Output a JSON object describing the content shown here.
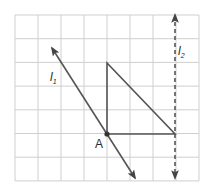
{
  "figure": {
    "grid": {
      "columns": 8,
      "rows": 7,
      "origin_x": 15,
      "origin_y": 15,
      "cell_w": 23,
      "cell_h": 23.7,
      "line_color": "#cfcfcf"
    },
    "triangle": {
      "vertices": [
        [
          107,
          63
        ],
        [
          107,
          134
        ],
        [
          175,
          134
        ]
      ],
      "stroke": "#555555"
    },
    "point_A": {
      "label": "A",
      "x": 107,
      "y": 134
    },
    "line_l1": {
      "label": "l",
      "subscript": "1",
      "from": [
        52,
        48
      ],
      "to": [
        135,
        178
      ],
      "style": "solid",
      "stroke": "#555555"
    },
    "line_l2": {
      "label": "l",
      "subscript": "2",
      "from": [
        175,
        15
      ],
      "to": [
        175,
        178
      ],
      "style": "dashed",
      "stroke": "#555555"
    }
  }
}
